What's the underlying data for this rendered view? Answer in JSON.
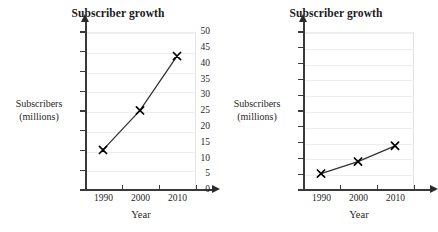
{
  "figure": {
    "panels": [
      {
        "id": "left",
        "title": "Subscriber growth",
        "ylabel_line1": "Subscribers",
        "ylabel_line2": "(millions)",
        "xlabel": "Year",
        "yticks": [
          "0",
          "2",
          "4",
          "6",
          "8",
          "10",
          "12",
          "14",
          "16"
        ],
        "xticks": [
          "1990",
          "2000",
          "2010"
        ]
      },
      {
        "id": "right",
        "title": "Subscriber growth",
        "ylabel_line1": "Subscribers",
        "ylabel_line2": "(millions)",
        "xlabel": "Year",
        "yticks": [
          "0",
          "5",
          "10",
          "15",
          "20",
          "25",
          "30",
          "35",
          "40",
          "45",
          "50"
        ],
        "xticks": [
          "1990",
          "2000",
          "2010"
        ]
      }
    ]
  },
  "chart_data": [
    {
      "type": "line",
      "title": "Subscriber growth",
      "xlabel": "Year",
      "ylabel": "Subscribers (millions)",
      "x": [
        1990,
        2000,
        2010
      ],
      "categories": [
        "1990",
        "2000",
        "2010"
      ],
      "values": [
        4,
        8,
        13.5
      ],
      "ylim": [
        0,
        17
      ],
      "yticks": [
        0,
        2,
        4,
        6,
        8,
        10,
        12,
        14,
        16
      ],
      "xlim": [
        1985,
        2017
      ],
      "xticks": [
        1990,
        2000,
        2010
      ],
      "grid": true,
      "legend": "none",
      "marker": "x",
      "line_color": "#333333",
      "marker_color": "#000000"
    },
    {
      "type": "line",
      "title": "Subscriber growth",
      "xlabel": "Year",
      "ylabel": "Subscribers (millions)",
      "x": [
        1990,
        2000,
        2010
      ],
      "categories": [
        "1990",
        "2000",
        "2010"
      ],
      "values": [
        5,
        8.8,
        13.8
      ],
      "ylim": [
        0,
        53
      ],
      "yticks": [
        0,
        5,
        10,
        15,
        20,
        25,
        30,
        35,
        40,
        45,
        50
      ],
      "xlim": [
        1985,
        2017
      ],
      "xticks": [
        1990,
        2000,
        2010
      ],
      "grid": true,
      "legend": "none",
      "marker": "x",
      "line_color": "#333333",
      "marker_color": "#000000"
    }
  ],
  "colors": {
    "background": "#ffffff",
    "axis": "#3a3a3a",
    "grid": "#ededed",
    "text": "#1f1f1f",
    "series": "#333333"
  }
}
